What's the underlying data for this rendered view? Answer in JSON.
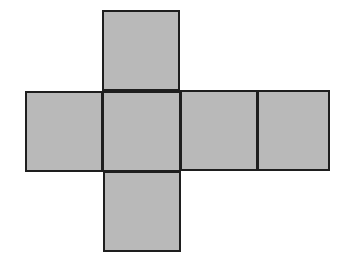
{
  "diagram": {
    "type": "cube-net",
    "fill_color": "#b9b9b9",
    "stroke_color": "#1e1e1e",
    "faces": [
      {
        "id": "top",
        "x": 102,
        "y": 10,
        "w": 78,
        "h": 81
      },
      {
        "id": "left",
        "x": 25,
        "y": 91,
        "w": 78,
        "h": 81
      },
      {
        "id": "center",
        "x": 102,
        "y": 91,
        "w": 79,
        "h": 81
      },
      {
        "id": "right",
        "x": 180,
        "y": 90,
        "w": 78,
        "h": 81
      },
      {
        "id": "far-right",
        "x": 257,
        "y": 90,
        "w": 73,
        "h": 81
      },
      {
        "id": "bottom",
        "x": 103,
        "y": 171,
        "w": 78,
        "h": 81
      }
    ]
  }
}
